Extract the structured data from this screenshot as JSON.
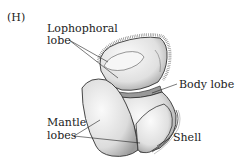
{
  "figure": {
    "panel_label": "(H)",
    "labels": {
      "lophophoral_line1": "Lophophoral",
      "lophophoral_line2": "lobe",
      "body_lobe": "Body lobe",
      "mantle_line1": "Mantle",
      "mantle_line2": "lobes",
      "shell": "Shell"
    },
    "colors": {
      "outline": "#333333",
      "fill_light": "#f2f2f2",
      "fill_shade": "#c8c8c8",
      "text": "#222222"
    }
  }
}
